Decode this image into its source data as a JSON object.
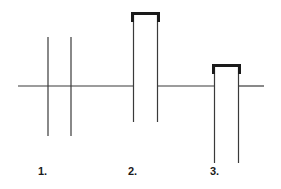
{
  "diagram": {
    "title": "",
    "background_color": "#ffffff",
    "stroke_color": "#3a3a3a",
    "bracket_color": "#1a1a1a",
    "baseline": {
      "name": "horizontal-baseline",
      "y": 86,
      "segments": [
        {
          "x1": 18,
          "x2": 134
        },
        {
          "x1": 157,
          "x2": 215
        },
        {
          "x1": 238,
          "x2": 264
        }
      ]
    },
    "figures": [
      {
        "id": "figure-1",
        "label": "1.",
        "label_x": 38,
        "label_y": 166,
        "type": "two-crossing-verticals",
        "strokes": [
          {
            "name": "vertical-left",
            "x": 48,
            "y1": 37,
            "y2": 136
          },
          {
            "name": "vertical-right",
            "x": 71,
            "y1": 37,
            "y2": 136
          }
        ]
      },
      {
        "id": "figure-2",
        "label": "2.",
        "label_x": 128,
        "label_y": 166,
        "type": "tall-bracket-loop",
        "bracket": {
          "name": "bracket-top",
          "x1": 133,
          "x2": 158,
          "y": 14,
          "thickness": 3
        },
        "strokes": [
          {
            "name": "vertical-left",
            "x": 133,
            "y1": 14,
            "y2": 122
          },
          {
            "name": "vertical-right",
            "x": 158,
            "y1": 14,
            "y2": 122
          }
        ]
      },
      {
        "id": "figure-3",
        "label": "3.",
        "label_x": 210,
        "label_y": 166,
        "type": "short-bracket-loop",
        "bracket": {
          "name": "bracket-top",
          "x1": 214,
          "x2": 239,
          "y": 66,
          "thickness": 3
        },
        "strokes": [
          {
            "name": "vertical-left",
            "x": 214,
            "y1": 66,
            "y2": 163
          },
          {
            "name": "vertical-right",
            "x": 239,
            "y1": 66,
            "y2": 163
          }
        ]
      }
    ]
  },
  "labels": {
    "one": "1.",
    "two": "2.",
    "three": "3."
  }
}
